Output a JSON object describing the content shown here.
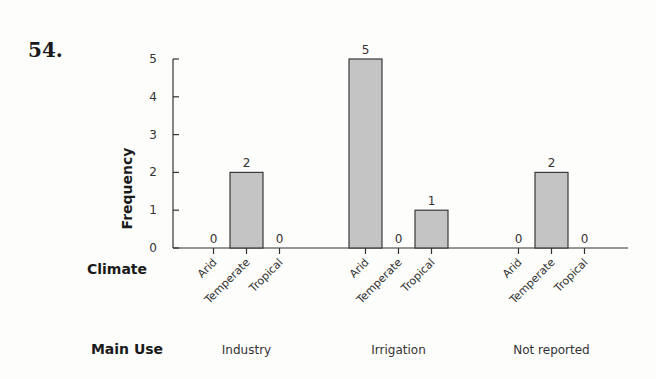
{
  "question_number": "54.",
  "chart_data": {
    "type": "bar",
    "title": "",
    "xlabel": "",
    "ylabel": "Frequency",
    "ylim": [
      0,
      5
    ],
    "yticks": [
      0,
      1,
      2,
      3,
      4,
      5
    ],
    "grid": false,
    "row_labels": {
      "climate": "Climate",
      "main_use": "Main Use"
    },
    "groups": [
      {
        "name": "Industry",
        "categories": [
          "Arid",
          "Temperate",
          "Tropical"
        ],
        "values": [
          0,
          2,
          0
        ]
      },
      {
        "name": "Irrigation",
        "categories": [
          "Arid",
          "Temperate",
          "Tropical"
        ],
        "values": [
          5,
          0,
          1
        ]
      },
      {
        "name": "Not reported",
        "categories": [
          "Arid",
          "Temperate",
          "Tropical"
        ],
        "values": [
          0,
          2,
          0
        ]
      }
    ],
    "bar_color": "#c4c4c4",
    "bar_edge_color": "#3a3a3a"
  }
}
